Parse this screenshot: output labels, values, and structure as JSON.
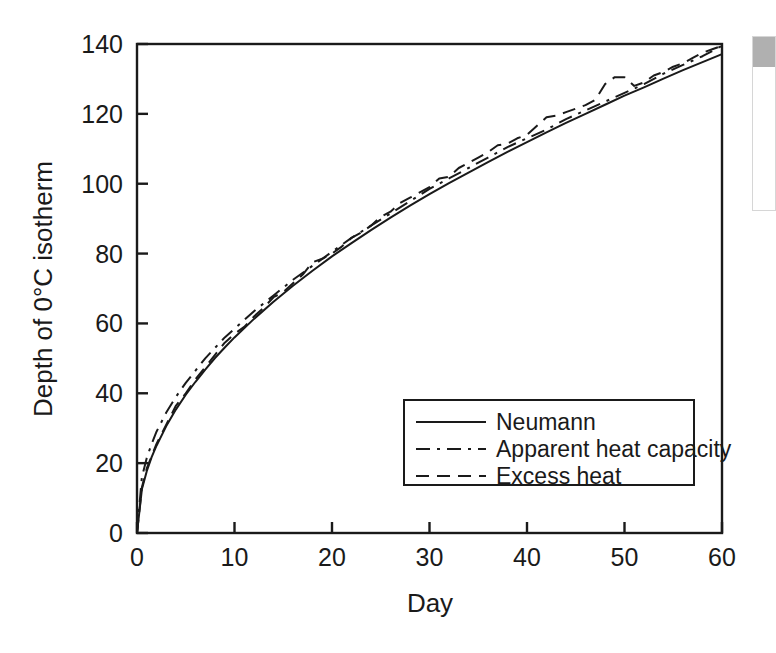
{
  "figure": {
    "background_color": "#ffffff",
    "line_color": "#1a1a1a",
    "axis_color": "#1a1a1a"
  },
  "edge_panel": {
    "name": "cut-off-side-panel",
    "header_color": "#b0b0b0",
    "border_color": "#d6d6d6"
  },
  "chart_data": {
    "type": "line",
    "title": "",
    "subtitle": "",
    "xlabel": "Day",
    "ylabel": "Depth of 0°C isotherm",
    "xlim": [
      0,
      60
    ],
    "ylim": [
      0,
      140
    ],
    "xticks": [
      0,
      10,
      20,
      30,
      40,
      50,
      60
    ],
    "yticks": [
      0,
      20,
      40,
      60,
      80,
      100,
      120,
      140
    ],
    "xtick_labels": [
      "0",
      "10",
      "20",
      "30",
      "40",
      "50",
      "60"
    ],
    "ytick_labels": [
      "0",
      "20",
      "40",
      "60",
      "80",
      "100",
      "120",
      "140"
    ],
    "grid": false,
    "legend_position": "lower right",
    "frame": true,
    "tick_direction": "out",
    "series": [
      {
        "name": "Neumann",
        "linestyle": "solid",
        "color": "#1a1a1a",
        "linewidth": 2,
        "x": [
          0,
          0.5,
          1,
          1.5,
          2,
          3,
          4,
          5,
          6,
          7,
          8,
          9,
          10,
          12,
          14,
          16,
          18,
          20,
          22,
          24,
          26,
          28,
          30,
          32,
          34,
          36,
          38,
          40,
          42,
          44,
          46,
          48,
          50,
          52,
          54,
          56,
          58,
          60
        ],
        "y": [
          0,
          12.5,
          17.7,
          21.7,
          25.0,
          30.6,
          35.4,
          39.6,
          43.3,
          46.8,
          50.1,
          53.1,
          56.0,
          61.3,
          66.2,
          70.8,
          75.1,
          79.2,
          83.0,
          86.7,
          90.3,
          93.7,
          97.0,
          100.2,
          103.2,
          106.2,
          109.1,
          111.9,
          114.7,
          117.4,
          120.0,
          122.6,
          125.2,
          127.6,
          130.1,
          132.5,
          134.8,
          137.1
        ]
      },
      {
        "name": "Apparent heat capacity",
        "linestyle": "dashdot",
        "color": "#1a1a1a",
        "linewidth": 2,
        "x": [
          0,
          0.5,
          1,
          1.5,
          2,
          3,
          4,
          5,
          6,
          7,
          8,
          9,
          10,
          12,
          14,
          16,
          18,
          20,
          22,
          24,
          26,
          28,
          30,
          32,
          34,
          36,
          38,
          40,
          42,
          44,
          46,
          48,
          50,
          52,
          54,
          56,
          58,
          60
        ],
        "y": [
          0,
          16.0,
          21.5,
          25.5,
          29.0,
          34.5,
          39.0,
          43.0,
          46.5,
          50.0,
          53.0,
          56.0,
          58.5,
          63.5,
          68.0,
          72.5,
          76.5,
          80.5,
          84.5,
          88.0,
          91.5,
          95.0,
          98.5,
          101.5,
          104.5,
          107.5,
          110.5,
          113.0,
          115.5,
          118.5,
          121.0,
          123.5,
          126.0,
          128.5,
          131.5,
          134.0,
          136.5,
          139.5
        ]
      },
      {
        "name": "Excess heat",
        "linestyle": "dashed",
        "color": "#1a1a1a",
        "linewidth": 2,
        "x": [
          0,
          0.5,
          1,
          1.5,
          2,
          3,
          4,
          5,
          6,
          7,
          8,
          9,
          10,
          11,
          12,
          13,
          14,
          15,
          16,
          17,
          18,
          19,
          20,
          21,
          22,
          23,
          24,
          25,
          26,
          27,
          28,
          29,
          30,
          31,
          32,
          33,
          34,
          35,
          36,
          37,
          38,
          39,
          40,
          41,
          42,
          43,
          44,
          45,
          46,
          47,
          48,
          49,
          50,
          51,
          52,
          53,
          54,
          55,
          56,
          57,
          58,
          59,
          60
        ],
        "y": [
          0,
          13.0,
          18.5,
          22.0,
          25.5,
          31.0,
          36.5,
          40.0,
          44.0,
          47.5,
          51.0,
          54.5,
          57.0,
          59.0,
          62.0,
          64.5,
          67.5,
          69.0,
          71.5,
          74.0,
          77.5,
          78.5,
          80.0,
          82.0,
          84.5,
          86.0,
          88.0,
          90.5,
          92.0,
          94.5,
          96.0,
          97.5,
          99.0,
          101.5,
          102.0,
          104.5,
          106.0,
          107.5,
          109.0,
          111.0,
          111.5,
          113.0,
          114.0,
          116.5,
          119.0,
          119.5,
          120.5,
          121.5,
          122.5,
          124.0,
          128.5,
          130.5,
          130.5,
          128.0,
          129.0,
          131.0,
          132.0,
          133.5,
          134.5,
          136.0,
          137.5,
          138.5,
          139.5
        ]
      }
    ],
    "legend_entries": [
      {
        "label": "Neumann",
        "linestyle": "solid"
      },
      {
        "label": "Apparent heat capacity",
        "linestyle": "dashdot"
      },
      {
        "label": "Excess heat",
        "linestyle": "dashed"
      }
    ]
  }
}
